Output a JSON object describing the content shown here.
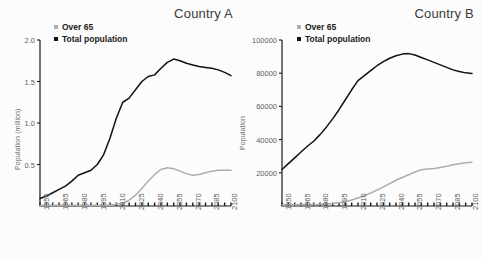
{
  "figure": {
    "width": 482,
    "height": 258,
    "background": "#ffffff",
    "panel_background": "#fcfcfc"
  },
  "colors": {
    "total_population": "#111111",
    "over_65": "#adadad",
    "axis": "#1a1a1a",
    "tick_text": "#5d5d5d",
    "title_text": "#3a3a3a"
  },
  "chart_data": [
    {
      "type": "line",
      "title": "Country A",
      "xlabel": "",
      "ylabel": "Population (million)",
      "grid": false,
      "legend_position": "top-left",
      "xlim": [
        1950,
        2100
      ],
      "ylim": [
        0,
        2.0
      ],
      "xticks": [
        1950,
        1965,
        1980,
        1995,
        2010,
        2025,
        2040,
        2055,
        2070,
        2085,
        2100
      ],
      "yticks": [
        0.5,
        1.0,
        1.5,
        2.0
      ],
      "ytick_labels": [
        "0.5",
        "1.0",
        "1.5",
        "2.0"
      ],
      "x": [
        1950,
        1955,
        1960,
        1965,
        1970,
        1975,
        1980,
        1985,
        1990,
        1995,
        2000,
        2005,
        2010,
        2015,
        2020,
        2025,
        2030,
        2035,
        2040,
        2045,
        2050,
        2055,
        2060,
        2065,
        2070,
        2075,
        2080,
        2085,
        2090,
        2095,
        2100
      ],
      "series": [
        {
          "name": "Total population",
          "color": "#111111",
          "values": [
            0.09,
            0.12,
            0.16,
            0.2,
            0.24,
            0.3,
            0.37,
            0.4,
            0.43,
            0.5,
            0.62,
            0.82,
            1.06,
            1.25,
            1.3,
            1.4,
            1.5,
            1.56,
            1.58,
            1.66,
            1.73,
            1.77,
            1.75,
            1.72,
            1.7,
            1.68,
            1.67,
            1.66,
            1.64,
            1.61,
            1.57
          ]
        },
        {
          "name": "Over 65",
          "color": "#adadad",
          "values": [
            0.01,
            0.01,
            0.01,
            0.01,
            0.01,
            0.01,
            0.01,
            0.01,
            0.01,
            0.01,
            0.01,
            0.01,
            0.02,
            0.03,
            0.07,
            0.13,
            0.21,
            0.3,
            0.38,
            0.44,
            0.46,
            0.45,
            0.42,
            0.39,
            0.37,
            0.38,
            0.4,
            0.42,
            0.43,
            0.43,
            0.43
          ]
        }
      ]
    },
    {
      "type": "line",
      "title": "Country B",
      "xlabel": "",
      "ylabel": "Population",
      "grid": false,
      "legend_position": "top-left",
      "xlim": [
        1950,
        2100
      ],
      "ylim": [
        0,
        100000
      ],
      "xticks": [
        1950,
        1965,
        1980,
        1995,
        2010,
        2025,
        2040,
        2055,
        2070,
        2085,
        2100
      ],
      "yticks": [
        20000,
        40000,
        60000,
        80000,
        100000
      ],
      "ytick_labels": [
        "20000",
        "40000",
        "60000",
        "80000",
        "100000"
      ],
      "x": [
        1950,
        1955,
        1960,
        1965,
        1970,
        1975,
        1980,
        1985,
        1990,
        1995,
        2000,
        2005,
        2010,
        2015,
        2020,
        2025,
        2030,
        2035,
        2040,
        2045,
        2050,
        2055,
        2060,
        2065,
        2070,
        2075,
        2080,
        2085,
        2090,
        2095,
        2100
      ],
      "series": [
        {
          "name": "Total population",
          "color": "#111111",
          "values": [
            22000,
            25500,
            29000,
            32500,
            36000,
            39000,
            43000,
            47500,
            52500,
            58000,
            64000,
            70000,
            75500,
            78500,
            81500,
            84500,
            87000,
            89000,
            90500,
            91500,
            91800,
            91000,
            89500,
            88000,
            86500,
            85000,
            83500,
            82000,
            81000,
            80200,
            79800
          ]
        },
        {
          "name": "Over 65",
          "color": "#adadad",
          "values": [
            700,
            750,
            800,
            850,
            900,
            950,
            1000,
            1200,
            1500,
            1900,
            2600,
            3600,
            4800,
            6200,
            7800,
            9600,
            11500,
            13500,
            15500,
            17200,
            18800,
            20500,
            21800,
            22300,
            22600,
            23200,
            24000,
            24800,
            25500,
            26000,
            26400
          ]
        }
      ]
    }
  ],
  "legend_entries": [
    {
      "label": "Over 65",
      "color": "#adadad",
      "marker": "square-gray"
    },
    {
      "label": "Total population",
      "color": "#111111",
      "marker": "square-black"
    }
  ]
}
